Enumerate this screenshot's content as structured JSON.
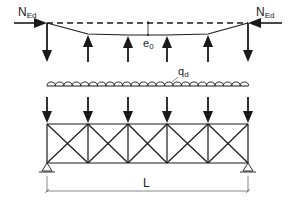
{
  "figure": {
    "caption_fragment": "",
    "labels": {
      "axial_force_left": {
        "main": "N",
        "sub": "Ed"
      },
      "axial_force_right": {
        "main": "N",
        "sub": "Ed"
      },
      "imperfection": {
        "main": "e",
        "sub": "0"
      },
      "distributed_load": {
        "main": "q",
        "sub": "d"
      },
      "span": "L"
    },
    "truss": {
      "panels": 5,
      "node_x": [
        47,
        88,
        128,
        167,
        208,
        248
      ],
      "top_chord_y": 124,
      "bottom_chord_y": 163
    },
    "colors": {
      "line": "#1a1a1a",
      "dim_line": "#555555",
      "background": "#ffffff"
    }
  }
}
